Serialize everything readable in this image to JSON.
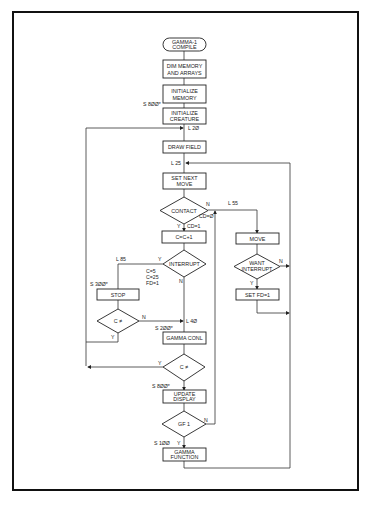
{
  "diagram": {
    "type": "flowchart",
    "title": "GAMMA-1 COMPILE",
    "nodes": {
      "start": [
        "GAMMA-1",
        "COMPILE"
      ],
      "dim": [
        "DIM MEMORY",
        "AND ARRAYS"
      ],
      "init_mem": [
        "INITIALIZE",
        "MEMORY"
      ],
      "init_creature": [
        "INITIALIZE",
        "CREATURE"
      ],
      "draw_field": "DRAW FIELD",
      "set_next_move": [
        "SET NEXT",
        "MOVE"
      ],
      "contact": "CONTACT",
      "c_inc": "C=C+1",
      "interrupt": "INTERRUPT",
      "stop": "STOP",
      "c_ne_left": "C ≠",
      "gamma_conl": "GAMMA CONL",
      "c_ne_main": "C ≠",
      "update_display": [
        "UPDATE",
        "DISPLAY"
      ],
      "gf1": "GF  1",
      "gamma_function": [
        "GAMMA",
        "FUNCTION"
      ],
      "move": "MOVE",
      "want_interrupt": [
        "WANT",
        "INTERRUPT"
      ],
      "set_fd": "SET FD=1"
    },
    "labels": {
      "s800": "S 8ØØ*",
      "l20": "L 2Ø",
      "l25": "L 25",
      "contact_n": "N",
      "cd0": "CD=Ø",
      "contact_y": "Y",
      "cd1": "CD=1",
      "l55": "L 55",
      "l85": "L 85",
      "interrupt_y": "Y",
      "interrupt_n": "N",
      "c5": "C=5",
      "c25": "C=25",
      "fd1": "FD=1",
      "s300": "S 3ØØ*",
      "c_left_n": "N",
      "c_left_y": "Y",
      "l40": "L 4Ø",
      "s200": "S 2ØØ*",
      "c_main_y": "Y",
      "s800b": "S 8ØØ*",
      "gf_n": "N",
      "gf_y": "Y",
      "s100": "S 1ØØ",
      "want_n": "N",
      "want_y": "Y"
    }
  }
}
